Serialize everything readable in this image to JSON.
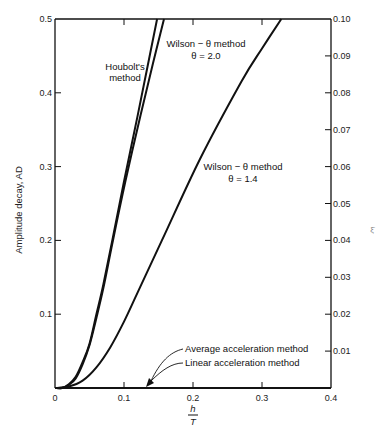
{
  "chart_data": {
    "type": "line",
    "title": "",
    "xlabel": "h/T",
    "xlabel_numerator": "h",
    "xlabel_denominator": "T",
    "ylabel": "Amplitude decay, AD",
    "y2label": "ξ̄",
    "xlim": [
      0,
      0.4
    ],
    "ylim": [
      0,
      0.5
    ],
    "y2lim": [
      0,
      0.1
    ],
    "grid": false,
    "x_ticks": [
      "0",
      "0.1",
      "0.2",
      "0.3",
      "0.4"
    ],
    "y_ticks": [
      "0.1",
      "0.2",
      "0.3",
      "0.4",
      "0.5"
    ],
    "y2_ticks": [
      "0.01",
      "0.02",
      "0.03",
      "0.04",
      "0.05",
      "0.06",
      "0.07",
      "0.08",
      "0.09",
      "0.10"
    ],
    "series": [
      {
        "name": "Houbolt's method",
        "x": [
          0.0,
          0.01,
          0.02,
          0.03,
          0.04,
          0.05,
          0.06,
          0.07,
          0.083,
          0.1,
          0.12,
          0.135,
          0.148
        ],
        "y": [
          0.0,
          0.0,
          0.005,
          0.015,
          0.035,
          0.06,
          0.1,
          0.14,
          0.2,
          0.28,
          0.37,
          0.44,
          0.5
        ]
      },
      {
        "name": "Wilson - θ method θ = 2.0",
        "x": [
          0.0,
          0.01,
          0.02,
          0.03,
          0.04,
          0.05,
          0.06,
          0.07,
          0.084,
          0.102,
          0.124,
          0.142,
          0.158
        ],
        "y": [
          0.0,
          0.0,
          0.004,
          0.013,
          0.032,
          0.058,
          0.095,
          0.135,
          0.2,
          0.28,
          0.37,
          0.44,
          0.5
        ]
      },
      {
        "name": "Wilson - θ method θ = 1.4",
        "x": [
          0.0,
          0.02,
          0.04,
          0.06,
          0.08,
          0.1,
          0.12,
          0.155,
          0.21,
          0.27,
          0.3,
          0.328
        ],
        "y": [
          0.0,
          0.002,
          0.01,
          0.028,
          0.055,
          0.09,
          0.13,
          0.2,
          0.31,
          0.415,
          0.46,
          0.5
        ]
      },
      {
        "name": "Average acceleration method",
        "x": [
          0.0,
          0.4
        ],
        "y": [
          0.0,
          0.0
        ]
      },
      {
        "name": "Linear acceleration method",
        "x": [
          0.0,
          0.4
        ],
        "y": [
          0.0,
          0.0
        ]
      }
    ],
    "annotations": [
      {
        "text": "Houbolt's method",
        "lines": [
          "Houbolt's",
          "method"
        ]
      },
      {
        "text": "Wilson - θ method θ = 2.0",
        "lines": [
          "Wilson  −  θ method",
          "θ  =  2.0"
        ]
      },
      {
        "text": "Wilson - θ method θ = 1.4",
        "lines": [
          "Wilson  −  θ method",
          "θ  =  1.4"
        ]
      },
      {
        "text": "Average acceleration method",
        "lines": [
          "Average acceleration method"
        ]
      },
      {
        "text": "Linear acceleration method",
        "lines": [
          "Linear acceleration method"
        ]
      }
    ],
    "legend": "none (inline annotations)"
  }
}
